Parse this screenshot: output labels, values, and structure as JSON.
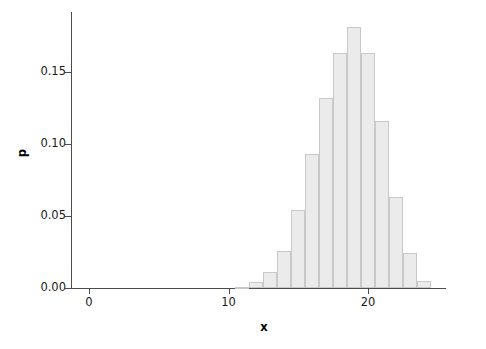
{
  "chart_data": {
    "type": "bar",
    "title": "",
    "subtitle": "",
    "xlabel": "x",
    "ylabel": "p",
    "xlim": [
      -1.5,
      25.6
    ],
    "ylim": [
      0.0,
      0.1875
    ],
    "grid": false,
    "legend": null,
    "x_ticks": [
      0,
      10,
      20
    ],
    "x_tick_labels": [
      "0",
      "10",
      "20"
    ],
    "y_ticks": [
      0.0,
      0.05,
      0.1,
      0.15
    ],
    "y_tick_labels": [
      "0.00",
      "0.05",
      "0.10",
      "0.15"
    ],
    "categories": [
      0,
      1,
      2,
      3,
      4,
      5,
      6,
      7,
      8,
      9,
      10,
      11,
      12,
      13,
      14,
      15,
      16,
      17,
      18,
      19,
      20,
      21,
      22,
      23,
      24,
      25
    ],
    "values": [
      0.0,
      0.0,
      0.0,
      0.0,
      0.0,
      0.0,
      0.0,
      0.0,
      0.0,
      0.0,
      0.0,
      0.001,
      0.004,
      0.011,
      0.026,
      0.054,
      0.093,
      0.132,
      0.163,
      0.181,
      0.163,
      0.116,
      0.063,
      0.024,
      0.005,
      0.0
    ],
    "bar_width": 1.0,
    "bar_fill_color": "#ebebeb",
    "bar_border_color": "#c9c9c9",
    "axis_color": "#4d4d4d",
    "background_color": "#ffffff"
  }
}
